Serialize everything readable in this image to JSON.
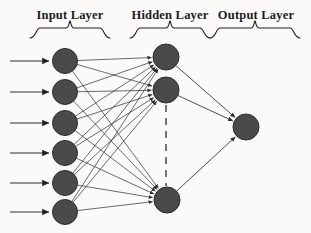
{
  "diagram": {
    "type": "feedforward-neural-network",
    "background_color": "#fbfaf8",
    "node_fill_color": "#4a4a4a",
    "node_stroke_color": "#2b2b2b",
    "edge_color": "#3a3a3a",
    "label_color": "#1c1c1c"
  },
  "labels": {
    "input": "Input Layer",
    "hidden": "Hidden Layer",
    "output": "Output Layer"
  },
  "layers": [
    {
      "name": "input",
      "label": "Input Layer",
      "node_count": 6,
      "node_radius": 12.5,
      "center_x": 65,
      "nodes": [
        {
          "id": "i1",
          "cx": 65,
          "cy": 61
        },
        {
          "id": "i2",
          "cx": 65,
          "cy": 92
        },
        {
          "id": "i3",
          "cx": 65,
          "cy": 123
        },
        {
          "id": "i4",
          "cx": 65,
          "cy": 153
        },
        {
          "id": "i5",
          "cx": 65,
          "cy": 183
        },
        {
          "id": "i6",
          "cx": 65,
          "cy": 212
        }
      ],
      "brace": {
        "x1": 30,
        "x2": 110,
        "y": 26,
        "height": 12
      }
    },
    {
      "name": "hidden",
      "label": "Hidden Layer",
      "node_count": 3,
      "node_radius": 13,
      "center_x": 166,
      "has_ellipsis": true,
      "nodes": [
        {
          "id": "h1",
          "cx": 166,
          "cy": 57
        },
        {
          "id": "h2",
          "cx": 166,
          "cy": 90
        },
        {
          "id": "h3",
          "cx": 167,
          "cy": 200
        }
      ],
      "ellipsis": {
        "x": 166,
        "y1": 105,
        "y2": 186,
        "style": "dashed"
      },
      "brace": {
        "x1": 130,
        "x2": 210,
        "y": 26,
        "height": 12
      }
    },
    {
      "name": "output",
      "label": "Output Layer",
      "node_count": 1,
      "node_radius": 13,
      "center_x": 246,
      "nodes": [
        {
          "id": "o1",
          "cx": 246,
          "cy": 127
        }
      ],
      "brace": {
        "x1": 210,
        "x2": 300,
        "y": 26,
        "height": 12
      }
    }
  ],
  "input_arrows": [
    {
      "x1": 10,
      "y1": 61,
      "x2": 49,
      "y2": 61
    },
    {
      "x1": 10,
      "y1": 92,
      "x2": 49,
      "y2": 92
    },
    {
      "x1": 10,
      "y1": 123,
      "x2": 49,
      "y2": 123
    },
    {
      "x1": 10,
      "y1": 153,
      "x2": 49,
      "y2": 153
    },
    {
      "x1": 10,
      "y1": 183,
      "x2": 49,
      "y2": 183
    },
    {
      "x1": 10,
      "y1": 212,
      "x2": 49,
      "y2": 212
    }
  ],
  "edges": {
    "input_to_hidden": [
      [
        "i1",
        "h1"
      ],
      [
        "i1",
        "h2"
      ],
      [
        "i1",
        "h3"
      ],
      [
        "i2",
        "h1"
      ],
      [
        "i2",
        "h2"
      ],
      [
        "i2",
        "h3"
      ],
      [
        "i3",
        "h1"
      ],
      [
        "i3",
        "h2"
      ],
      [
        "i3",
        "h3"
      ],
      [
        "i4",
        "h1"
      ],
      [
        "i4",
        "h2"
      ],
      [
        "i4",
        "h3"
      ],
      [
        "i5",
        "h1"
      ],
      [
        "i5",
        "h2"
      ],
      [
        "i5",
        "h3"
      ],
      [
        "i6",
        "h1"
      ],
      [
        "i6",
        "h2"
      ],
      [
        "i6",
        "h3"
      ]
    ],
    "hidden_to_output": [
      [
        "h1",
        "o1"
      ],
      [
        "h2",
        "o1"
      ],
      [
        "h3",
        "o1"
      ]
    ]
  }
}
